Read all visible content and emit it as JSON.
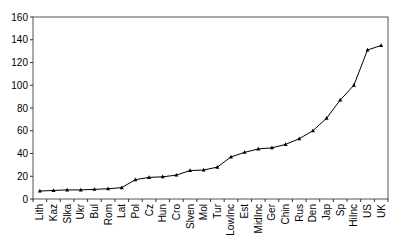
{
  "chart_data": {
    "type": "line",
    "title": "",
    "xlabel": "",
    "ylabel": "",
    "ylim": [
      0,
      160
    ],
    "yticks": [
      0,
      20,
      40,
      60,
      80,
      100,
      120,
      140,
      160
    ],
    "grid": false,
    "legend": null,
    "categories": [
      "Lith",
      "Kaz",
      "Slka",
      "Ukr",
      "Bul",
      "Rom",
      "Lat",
      "Pol",
      "Cz",
      "Hun",
      "Cro",
      "Slven",
      "Mol",
      "Tur",
      "LowInc",
      "Est",
      "MidInc",
      "Ger",
      "Chin",
      "Rus",
      "Den",
      "Jap",
      "Sp",
      "HiInc",
      "US",
      "UK"
    ],
    "series": [
      {
        "name": "series1",
        "values": [
          7,
          7.5,
          8,
          8,
          8.5,
          9,
          10,
          17,
          19,
          19.5,
          21,
          25,
          25.5,
          28,
          37,
          41,
          44,
          45,
          48,
          53,
          60,
          71,
          87,
          100,
          131,
          135
        ],
        "marker": "triangle",
        "color": "#000000"
      }
    ]
  }
}
